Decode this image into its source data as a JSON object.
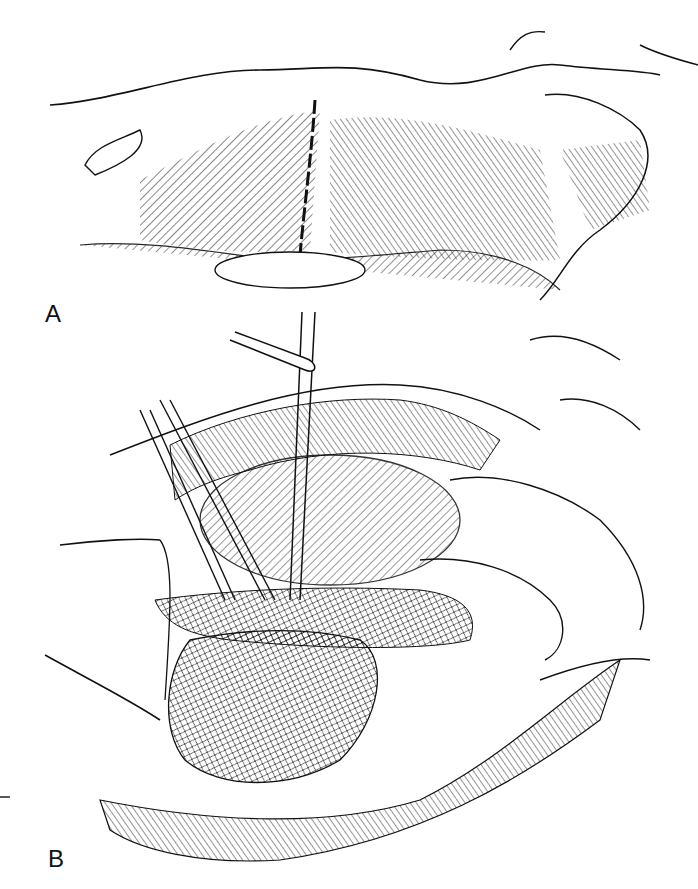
{
  "figure": {
    "panels": [
      {
        "id": "A",
        "label": "A",
        "description": "Infant torso lateral view with incision line"
      },
      {
        "id": "B",
        "label": "B",
        "description": "Operative field with retracted tissue and tubes"
      }
    ],
    "colors": {
      "ink": "#111111",
      "background": "#ffffff"
    }
  }
}
